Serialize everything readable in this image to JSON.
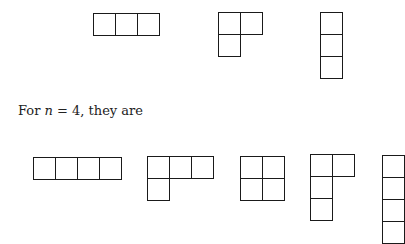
{
  "paragraph": {
    "prefix": "For ",
    "var": "n",
    "eq": " = 4, they are"
  },
  "cell_size": 23,
  "diagrams_n3": [
    {
      "name": "young-diagram-3",
      "left": 93,
      "top": 13,
      "shape": [
        3
      ]
    },
    {
      "name": "young-diagram-2-1",
      "left": 218,
      "top": 12,
      "shape": [
        2,
        1
      ]
    },
    {
      "name": "young-diagram-1-1-1",
      "left": 320,
      "top": 12,
      "shape": [
        1,
        1,
        1
      ]
    }
  ],
  "diagrams_n4": [
    {
      "name": "young-diagram-4",
      "left": 33,
      "top": 157,
      "shape": [
        4
      ]
    },
    {
      "name": "young-diagram-3-1",
      "left": 147,
      "top": 156,
      "shape": [
        3,
        1
      ]
    },
    {
      "name": "young-diagram-2-2",
      "left": 240,
      "top": 156,
      "shape": [
        2,
        2
      ]
    },
    {
      "name": "young-diagram-2-1-1",
      "left": 310,
      "top": 154,
      "shape": [
        2,
        1,
        1
      ]
    },
    {
      "name": "young-diagram-1-1-1-1",
      "left": 382,
      "top": 155,
      "shape": [
        1,
        1,
        1,
        1
      ]
    }
  ]
}
